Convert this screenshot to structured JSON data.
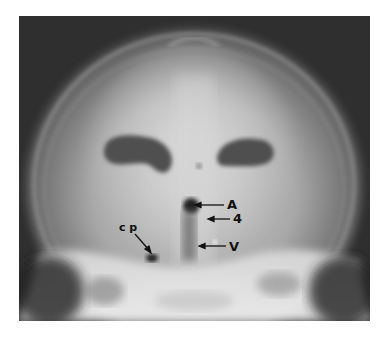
{
  "figure": {
    "background_color": "#2e2e2e",
    "labels": [
      {
        "id": "A",
        "text": "A"
      },
      {
        "id": "4",
        "text": "4"
      },
      {
        "id": "V",
        "text": "V"
      },
      {
        "id": "cp",
        "text": "c p"
      }
    ]
  }
}
